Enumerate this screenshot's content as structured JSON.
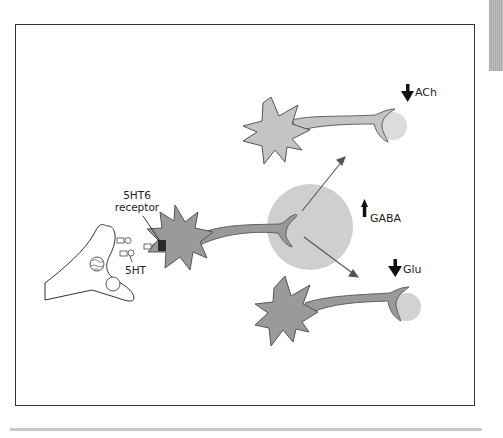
{
  "figure": {
    "labels": {
      "receptor_line1": "5HT6",
      "receptor_line2": "receptor",
      "serotonin": "5HT",
      "gaba": "GABA",
      "ach": "ACh",
      "glu": "Glu"
    },
    "arrows": {
      "gaba": "up",
      "ach": "down",
      "glu": "down"
    },
    "colors": {
      "frame": "#333333",
      "neuron_light": "#c4c4c4",
      "neuron_dark": "#9a9a9a",
      "gaba_cloud": "#cfcfcf",
      "terminal_cloud": "#dcdcdc",
      "receptor": "#2a2a2a",
      "arrow": "#111111"
    }
  }
}
